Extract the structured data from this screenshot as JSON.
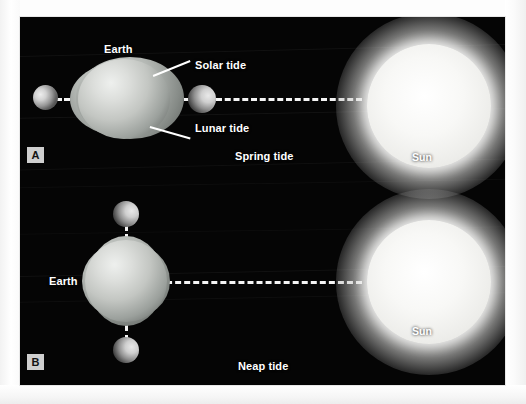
{
  "figure": {
    "background_color": "#ffffff",
    "sky_color": "#050505",
    "text_color": "#ffffff"
  },
  "panels": [
    {
      "tag": "A",
      "caption": "Spring tide",
      "labels": {
        "earth": "Earth",
        "solar_tide": "Solar tide",
        "lunar_tide": "Lunar tide",
        "sun": "Sun"
      },
      "bodies": {
        "moon_far": "Moon",
        "moon_near": "Moon",
        "earth": "Earth",
        "sun": "Sun"
      },
      "alignment": "Sun, Earth and Moon in a straight line (syzygy)"
    },
    {
      "tag": "B",
      "caption": "Neap tide",
      "labels": {
        "earth": "Earth",
        "sun": "Sun"
      },
      "bodies": {
        "moon_top": "Moon",
        "moon_bottom": "Moon",
        "earth": "Earth",
        "sun": "Sun"
      },
      "alignment": "Moon at right angles to the Sun-Earth line (quadrature)"
    }
  ],
  "icons": {
    "moon": "moon-icon",
    "earth": "earth-icon",
    "sun": "sun-icon"
  }
}
